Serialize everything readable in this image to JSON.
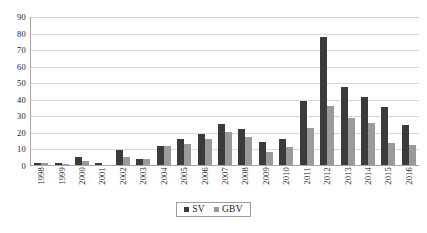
{
  "chart_data": {
    "type": "bar",
    "title": "",
    "subtitle": "",
    "xlabel": "",
    "ylabel": "",
    "ylim": [
      0,
      90
    ],
    "ytick_step": 10,
    "yticks": [
      "90",
      "80",
      "70",
      "60",
      "50",
      "40",
      "30",
      "20",
      "10",
      "0"
    ],
    "grid": true,
    "legend_position": "bottom-center",
    "categories": [
      "1998",
      "1999",
      "2000",
      "2001",
      "2002",
      "2003",
      "2004",
      "2005",
      "2006",
      "2007",
      "2008",
      "2009",
      "2010",
      "2011",
      "2012",
      "2013",
      "2014",
      "2015",
      "2016"
    ],
    "series": [
      {
        "name": "SV",
        "color": "#3b3b3b",
        "values": [
          1.5,
          1.3,
          4.6,
          1.5,
          8.8,
          3.6,
          11.7,
          15.8,
          18.8,
          24.6,
          21.6,
          13.7,
          15.5,
          38.5,
          77.2,
          47.3,
          41.3,
          35.3,
          24.3
        ]
      },
      {
        "name": "GBV",
        "color": "#9a9a9a",
        "values": [
          1.5,
          0.6,
          2.7,
          0.0,
          4.6,
          3.7,
          11.7,
          12.8,
          15.8,
          19.8,
          16.8,
          7.7,
          10.7,
          22.4,
          35.5,
          28.7,
          25.5,
          13.5,
          12.3
        ]
      }
    ]
  },
  "legend": {
    "entries": [
      {
        "label": "SV"
      },
      {
        "label": "GBV"
      }
    ]
  },
  "colors": {
    "series_sv": "#3b3b3b",
    "series_gbv": "#9a9a9a",
    "gridline": "#d9d9d9",
    "axis": "#a6a6a6",
    "background": "#ffffff"
  }
}
